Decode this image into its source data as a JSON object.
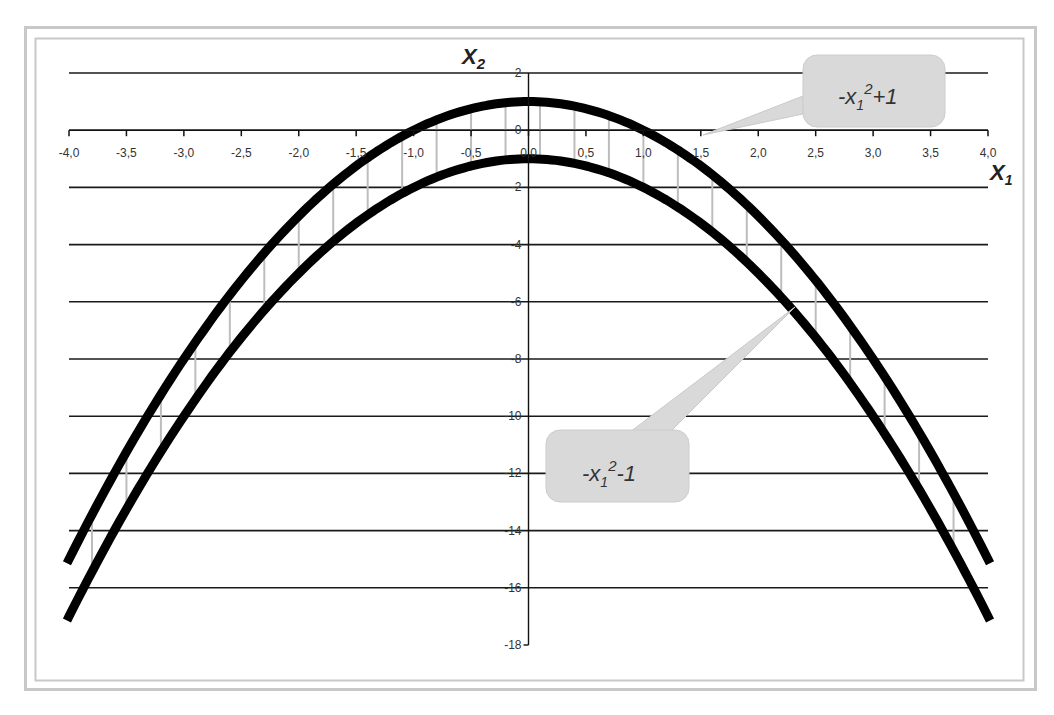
{
  "chart_data": {
    "type": "line",
    "title": "",
    "xlabel": "X1",
    "ylabel": "X2",
    "xlim": [
      -4.0,
      4.0
    ],
    "ylim": [
      -18,
      2
    ],
    "x_ticks": [
      "-4,0",
      "-3,5",
      "-3,0",
      "-2,5",
      "-2,0",
      "-1,5",
      "-1,0",
      "-0,5",
      "0,0",
      "0,5",
      "1,0",
      "1,5",
      "2,0",
      "2,5",
      "3,0",
      "3,5",
      "4,0"
    ],
    "y_ticks": [
      "2",
      "0",
      "-2",
      "-4",
      "-6",
      "-8",
      "-10",
      "-12",
      "-14",
      "-16",
      "-18"
    ],
    "grid": true,
    "legend": "none",
    "series": [
      {
        "name": "-x1^2+1",
        "formula": "-x1^2+1",
        "x": [
          -4.0,
          -3.5,
          -3.0,
          -2.5,
          -2.0,
          -1.5,
          -1.0,
          -0.5,
          0.0,
          0.5,
          1.0,
          1.5,
          2.0,
          2.5,
          3.0,
          3.5,
          4.0
        ],
        "values": [
          -15,
          -11.25,
          -8,
          -5.25,
          -3,
          -1.25,
          0,
          0.75,
          1,
          0.75,
          0,
          -1.25,
          -3,
          -5.25,
          -8,
          -11.25,
          -15
        ]
      },
      {
        "name": "-x1^2-1",
        "formula": "-x1^2-1",
        "x": [
          -4.0,
          -3.5,
          -3.0,
          -2.5,
          -2.0,
          -1.5,
          -1.0,
          -0.5,
          0.0,
          0.5,
          1.0,
          1.5,
          2.0,
          2.5,
          3.0,
          3.5,
          4.0
        ],
        "values": [
          -17,
          -13.25,
          -10,
          -7.25,
          -5,
          -3.25,
          -2,
          -1.25,
          -1,
          -1.25,
          -2,
          -3.25,
          -5,
          -7.25,
          -10,
          -13.25,
          -17
        ]
      }
    ],
    "annotations": [
      {
        "text_base": "-x",
        "sub": "1",
        "sup": "2",
        "tail": "+1",
        "target_series": "-x1^2+1"
      },
      {
        "text_base": "-x",
        "sub": "1",
        "sup": "2",
        "tail": "-1",
        "target_series": "-x1^2-1"
      }
    ],
    "shading": "gray vertical hatch lines between the two curves"
  },
  "axes": {
    "x_title_base": "X",
    "x_title_sub": "1",
    "y_title_base": "X",
    "y_title_sub": "2"
  },
  "callouts": {
    "upper": {
      "base": "-x",
      "sub": "1",
      "sup": "2",
      "tail": "+1"
    },
    "lower": {
      "base": "-x",
      "sub": "1",
      "sup": "2",
      "tail": "-1"
    }
  },
  "colors": {
    "curve": "#000000",
    "grid": "#1a1a1a",
    "hatch": "#bdbdbd",
    "callout_fill": "#d9d9d9",
    "frame": "#c8c8c8"
  }
}
